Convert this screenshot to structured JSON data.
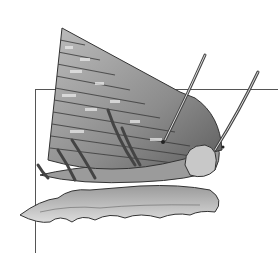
{
  "image": {
    "subject": "top snail illustration",
    "style": "grayscale pen-and-ink engraving",
    "colors": {
      "background": "#ffffff",
      "frame_line": "#555555",
      "ink_dark": "#2a2a2a",
      "ink_mid": "#8a8a8a",
      "ink_light": "#d4d4d4"
    }
  }
}
